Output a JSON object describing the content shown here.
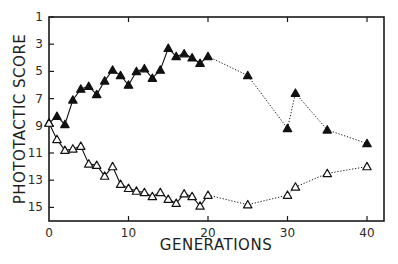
{
  "chart_data": {
    "type": "line",
    "title": "",
    "xlabel": "GENERATIONS",
    "ylabel": "PHOTOTACTIC SCORE",
    "xlim": [
      0,
      42
    ],
    "ylim": [
      16,
      1
    ],
    "y_inverted": true,
    "grid": false,
    "legend": null,
    "x_ticks": [
      0,
      10,
      20,
      30,
      40
    ],
    "x_tick_labels": [
      "0",
      "10",
      "20",
      "30",
      "40"
    ],
    "y_ticks": [
      1,
      3,
      5,
      7,
      9,
      11,
      13,
      15
    ],
    "y_tick_labels": [
      "1",
      "3",
      "5",
      "7",
      "9",
      "11",
      "13",
      "15"
    ],
    "series": [
      {
        "name": "Selected (filled triangles)",
        "marker": "filled-triangle",
        "color": "#111111",
        "solid_until_x": 20,
        "dotted_after_x": 20,
        "x": [
          0,
          1,
          2,
          3,
          4,
          5,
          6,
          7,
          8,
          9,
          10,
          11,
          12,
          13,
          14,
          15,
          16,
          17,
          18,
          19,
          20,
          25,
          30,
          31,
          35,
          40
        ],
        "values": [
          8.8,
          8.3,
          8.9,
          7.1,
          6.3,
          6.1,
          6.7,
          5.7,
          4.9,
          5.3,
          6.0,
          5.0,
          4.8,
          5.5,
          4.9,
          3.3,
          3.9,
          3.7,
          4.0,
          4.4,
          3.9,
          5.3,
          9.2,
          6.6,
          9.3,
          10.3
        ]
      },
      {
        "name": "Selected (open triangles)",
        "marker": "open-triangle",
        "color": "#111111",
        "solid_until_x": 20,
        "dotted_after_x": 20,
        "x": [
          0,
          1,
          2,
          3,
          4,
          5,
          6,
          7,
          8,
          9,
          10,
          11,
          12,
          13,
          14,
          15,
          16,
          17,
          18,
          19,
          20,
          25,
          30,
          31,
          35,
          40
        ],
        "values": [
          8.8,
          10.0,
          10.8,
          10.7,
          10.5,
          11.8,
          11.9,
          12.7,
          12.0,
          13.3,
          13.6,
          13.8,
          13.9,
          14.2,
          13.9,
          14.4,
          14.7,
          14.0,
          14.2,
          14.9,
          14.1,
          14.8,
          14.1,
          13.5,
          12.5,
          12.0
        ]
      }
    ]
  },
  "layout": {
    "plot_left": 49,
    "plot_right": 384,
    "plot_top": 17,
    "plot_bottom": 221,
    "x0_px": 49,
    "x_px_per_unit": 7.95,
    "y1_px": 17,
    "y_px_per_unit": 13.6
  }
}
